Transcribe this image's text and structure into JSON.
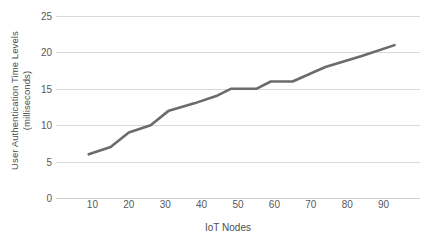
{
  "chart_data": {
    "type": "line",
    "title": "",
    "subtitle": "",
    "xlabel": "IoT Nodes",
    "ylabel": "User Authentication Time Levels (milliseconds)",
    "ylabel_line1": "User Authentication Time Levels",
    "ylabel_line2": "(milliseconds)",
    "xlim": [
      0,
      100
    ],
    "ylim": [
      0,
      25
    ],
    "xticks": [
      10,
      20,
      30,
      40,
      50,
      60,
      70,
      80,
      90
    ],
    "xtick_labels": [
      "10",
      "20",
      "30",
      "40",
      "50",
      "60",
      "70",
      "80",
      "90"
    ],
    "yticks": [
      0,
      5,
      10,
      15,
      20,
      25
    ],
    "ytick_labels": [
      "0",
      "5",
      "10",
      "15",
      "20",
      "25"
    ],
    "grid": "horizontal",
    "legend": "none",
    "series": [
      {
        "name": "User Authentication Time",
        "color": "#6b6b6b",
        "x": [
          9,
          15,
          20,
          26,
          31,
          38,
          44,
          48,
          55,
          59,
          65,
          74,
          84,
          93
        ],
        "values": [
          6,
          7,
          9,
          10,
          12,
          13,
          14,
          15,
          15,
          16,
          16,
          18,
          19.5,
          21
        ]
      }
    ]
  },
  "style": {
    "line_color": "#6b6b6b",
    "grid_color": "#d9d9d9",
    "axis_color": "#d0d0d0",
    "text_color": "#595959",
    "background": "#ffffff"
  }
}
